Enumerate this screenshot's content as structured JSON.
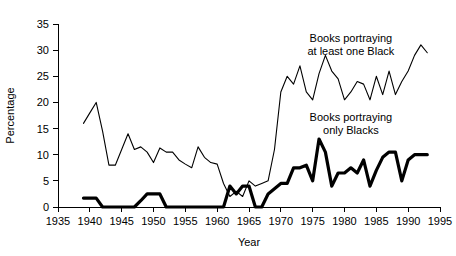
{
  "chart_data": {
    "type": "line",
    "title": "",
    "xlabel": "Year",
    "ylabel": "Percentage",
    "xlim": [
      1935,
      1995
    ],
    "ylim": [
      0,
      35
    ],
    "xticks": [
      1935,
      1940,
      1945,
      1950,
      1955,
      1960,
      1965,
      1970,
      1975,
      1980,
      1985,
      1990,
      1995
    ],
    "yticks": [
      0,
      5,
      10,
      15,
      20,
      25,
      30,
      35
    ],
    "grid": false,
    "legend_position": "inline-annotations",
    "annotations": [
      {
        "text": "Books portraying at least one Black",
        "line1": "Books portraying",
        "line2": "at least one Black",
        "x": 1981,
        "y": 31.5
      },
      {
        "text": "Books portraying only Blacks",
        "line1": "Books portraying",
        "line2": "only Blacks",
        "x": 1981,
        "y": 16.5
      }
    ],
    "series": [
      {
        "name": "Books portraying at least one Black",
        "style": "thin",
        "x": [
          1939,
          1940,
          1941,
          1942,
          1943,
          1944,
          1945,
          1946,
          1947,
          1948,
          1949,
          1950,
          1951,
          1952,
          1953,
          1954,
          1955,
          1956,
          1957,
          1958,
          1959,
          1960,
          1961,
          1962,
          1963,
          1964,
          1965,
          1966,
          1967,
          1968,
          1969,
          1970,
          1971,
          1972,
          1973,
          1974,
          1975,
          1976,
          1977,
          1978,
          1979,
          1980,
          1981,
          1982,
          1983,
          1984,
          1985,
          1986,
          1987,
          1988,
          1989,
          1990,
          1991,
          1992,
          1993
        ],
        "values": [
          16.0,
          18.0,
          20.0,
          14.5,
          8.0,
          8.0,
          11.0,
          14.0,
          11.0,
          11.5,
          10.5,
          8.5,
          11.3,
          10.5,
          10.5,
          9.0,
          8.2,
          7.5,
          11.5,
          9.5,
          8.5,
          8.2,
          4.5,
          2.0,
          3.0,
          2.0,
          5.0,
          4.0,
          4.5,
          5.0,
          11.0,
          22.0,
          25.0,
          23.5,
          27.0,
          22.0,
          20.5,
          25.5,
          29.0,
          26.0,
          24.5,
          20.5,
          22.0,
          24.0,
          23.5,
          20.5,
          25.0,
          21.5,
          26.0,
          21.5,
          24.0,
          26.0,
          29.0,
          31.0,
          29.5
        ]
      },
      {
        "name": "Books portraying only Blacks",
        "style": "thick",
        "x": [
          1939,
          1940,
          1941,
          1942,
          1943,
          1944,
          1945,
          1946,
          1947,
          1948,
          1949,
          1950,
          1951,
          1952,
          1953,
          1954,
          1955,
          1956,
          1957,
          1958,
          1959,
          1960,
          1961,
          1962,
          1963,
          1964,
          1965,
          1966,
          1967,
          1968,
          1969,
          1970,
          1971,
          1972,
          1973,
          1974,
          1975,
          1976,
          1977,
          1978,
          1979,
          1980,
          1981,
          1982,
          1983,
          1984,
          1985,
          1986,
          1987,
          1988,
          1989,
          1990,
          1991,
          1992,
          1993
        ],
        "values": [
          1.7,
          1.7,
          1.7,
          0.0,
          0.0,
          0.0,
          0.0,
          0.0,
          0.0,
          1.2,
          2.5,
          2.5,
          2.5,
          0.0,
          0.0,
          0.0,
          0.0,
          0.0,
          0.0,
          0.0,
          0.0,
          0.0,
          0.0,
          4.0,
          2.5,
          4.0,
          4.0,
          0.0,
          0.0,
          2.5,
          3.5,
          4.5,
          4.5,
          7.5,
          7.5,
          8.0,
          5.0,
          13.0,
          10.5,
          4.0,
          6.5,
          6.5,
          7.5,
          6.5,
          9.0,
          4.0,
          7.0,
          9.5,
          10.5,
          10.5,
          5.0,
          9.0,
          10.0,
          10.0,
          10.0
        ]
      }
    ]
  },
  "axes": {
    "y_title": "Percentage",
    "x_title": "Year",
    "x_tick_labels": [
      "1935",
      "1940",
      "1945",
      "1950",
      "1955",
      "1960",
      "1965",
      "1970",
      "1975",
      "1980",
      "1985",
      "1990",
      "1995"
    ],
    "y_tick_labels": [
      "0",
      "5",
      "10",
      "15",
      "20",
      "25",
      "30",
      "35"
    ]
  },
  "colors": {
    "line": "#000000",
    "background": "#ffffff",
    "text": "#000000"
  }
}
